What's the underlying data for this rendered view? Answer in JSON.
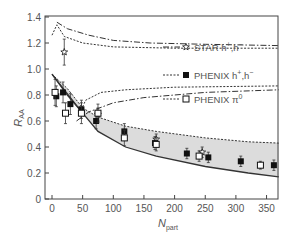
{
  "chart_data": {
    "type": "scatter",
    "title": "",
    "xlabel": "N_part",
    "xlabel_main": "N",
    "xlabel_sub": "part",
    "ylabel": "R_AA",
    "ylabel_main": "R",
    "ylabel_sub": "AA",
    "xlim": [
      0,
      380
    ],
    "ylim": [
      0,
      1.4
    ],
    "x_ticks": [
      0,
      50,
      100,
      150,
      200,
      250,
      300,
      350
    ],
    "y_ticks": [
      0,
      0.2,
      0.4,
      0.6,
      0.8,
      1.0,
      1.2,
      1.4
    ],
    "y_tick_labels": [
      "0",
      "0.2",
      "0.4",
      "0.6",
      "0.8",
      "1.0",
      "1.2",
      "1.4"
    ],
    "grid": false,
    "legend_position": "upper right",
    "legend": [
      {
        "label": "STAR h",
        "sup": "+",
        "label2": ",h",
        "sup2": "−",
        "marker": "open-star",
        "line": "dash-dot"
      },
      {
        "label": "PHENIX h",
        "sup": "+",
        "label2": ",h",
        "sup2": "−",
        "marker": "filled-square",
        "line": "dotted"
      },
      {
        "label": "PHENIX π",
        "sup": "0",
        "label2": "",
        "sup2": "",
        "marker": "open-square",
        "line": "dotted"
      }
    ],
    "series": [
      {
        "name": "STAR h+,h-",
        "marker": "open-star",
        "points": [
          {
            "x": 20,
            "y": 1.13,
            "err": 0.1
          },
          {
            "x": 75,
            "y": 0.65,
            "err": 0.05
          },
          {
            "x": 170,
            "y": 0.46,
            "err": 0.04
          },
          {
            "x": 245,
            "y": 0.36,
            "err": 0.04
          }
        ]
      },
      {
        "name": "PHENIX h+,h-",
        "marker": "filled-square",
        "points": [
          {
            "x": 7,
            "y": 0.79,
            "err": 0.08
          },
          {
            "x": 18,
            "y": 0.82,
            "err": 0.08
          },
          {
            "x": 30,
            "y": 0.73,
            "err": 0.08
          },
          {
            "x": 48,
            "y": 0.69,
            "err": 0.07
          },
          {
            "x": 72,
            "y": 0.6,
            "err": 0.06
          },
          {
            "x": 118,
            "y": 0.52,
            "err": 0.06
          },
          {
            "x": 168,
            "y": 0.43,
            "err": 0.05
          },
          {
            "x": 220,
            "y": 0.35,
            "err": 0.04
          },
          {
            "x": 255,
            "y": 0.32,
            "err": 0.04
          },
          {
            "x": 308,
            "y": 0.29,
            "err": 0.04
          },
          {
            "x": 362,
            "y": 0.26,
            "err": 0.04
          }
        ]
      },
      {
        "name": "PHENIX pi0",
        "marker": "open-square",
        "points": [
          {
            "x": 5,
            "y": 0.82,
            "err": 0.1
          },
          {
            "x": 22,
            "y": 0.66,
            "err": 0.08
          },
          {
            "x": 48,
            "y": 0.66,
            "err": 0.08
          },
          {
            "x": 75,
            "y": 0.66,
            "err": 0.07
          },
          {
            "x": 118,
            "y": 0.47,
            "err": 0.06
          },
          {
            "x": 170,
            "y": 0.42,
            "err": 0.05
          },
          {
            "x": 240,
            "y": 0.33,
            "err": 0.04
          },
          {
            "x": 340,
            "y": 0.26,
            "err": 0.03
          }
        ]
      }
    ],
    "curves": [
      {
        "name": "STAR upper band (dash-dot)",
        "style": "dash-dot",
        "points": [
          [
            8,
            1.36
          ],
          [
            25,
            1.31
          ],
          [
            60,
            1.26
          ],
          [
            100,
            1.22
          ],
          [
            160,
            1.2
          ],
          [
            250,
            1.19
          ],
          [
            370,
            1.18
          ]
        ]
      },
      {
        "name": "PHENIX upper band (dotted)",
        "style": "dotted",
        "points": [
          [
            0,
            1.26
          ],
          [
            8,
            1.34
          ],
          [
            20,
            1.25
          ],
          [
            50,
            1.2
          ],
          [
            100,
            1.17
          ],
          [
            200,
            1.16
          ],
          [
            370,
            1.16
          ]
        ]
      },
      {
        "name": "PHENIX lower band (dotted)",
        "style": "dotted",
        "points": [
          [
            45,
            0.66
          ],
          [
            55,
            0.76
          ],
          [
            80,
            0.82
          ],
          [
            120,
            0.84
          ],
          [
            200,
            0.86
          ],
          [
            370,
            0.87
          ]
        ]
      },
      {
        "name": "STAR lower band (dash-dot)",
        "style": "dash-dot",
        "points": [
          [
            40,
            0.6
          ],
          [
            60,
            0.67
          ],
          [
            100,
            0.74
          ],
          [
            150,
            0.78
          ],
          [
            250,
            0.82
          ],
          [
            370,
            0.84
          ]
        ]
      }
    ],
    "theory_band": {
      "name": "Jet quenching calculation (shaded)",
      "upper": [
        [
          0,
          0.96
        ],
        [
          25,
          0.85
        ],
        [
          50,
          0.7
        ],
        [
          75,
          0.63
        ],
        [
          120,
          0.56
        ],
        [
          170,
          0.52
        ],
        [
          250,
          0.47
        ],
        [
          320,
          0.44
        ],
        [
          370,
          0.43
        ]
      ],
      "lower": [
        [
          0,
          0.96
        ],
        [
          25,
          0.8
        ],
        [
          50,
          0.66
        ],
        [
          75,
          0.52
        ],
        [
          120,
          0.4
        ],
        [
          170,
          0.33
        ],
        [
          250,
          0.25
        ],
        [
          320,
          0.2
        ],
        [
          370,
          0.17
        ]
      ],
      "fill": "#dcdcdc"
    }
  },
  "colors": {
    "axis": "#444444",
    "text": "#555555",
    "band_fill": "#dcdcdc",
    "band_edge": "#333333",
    "marker": "#111111"
  }
}
